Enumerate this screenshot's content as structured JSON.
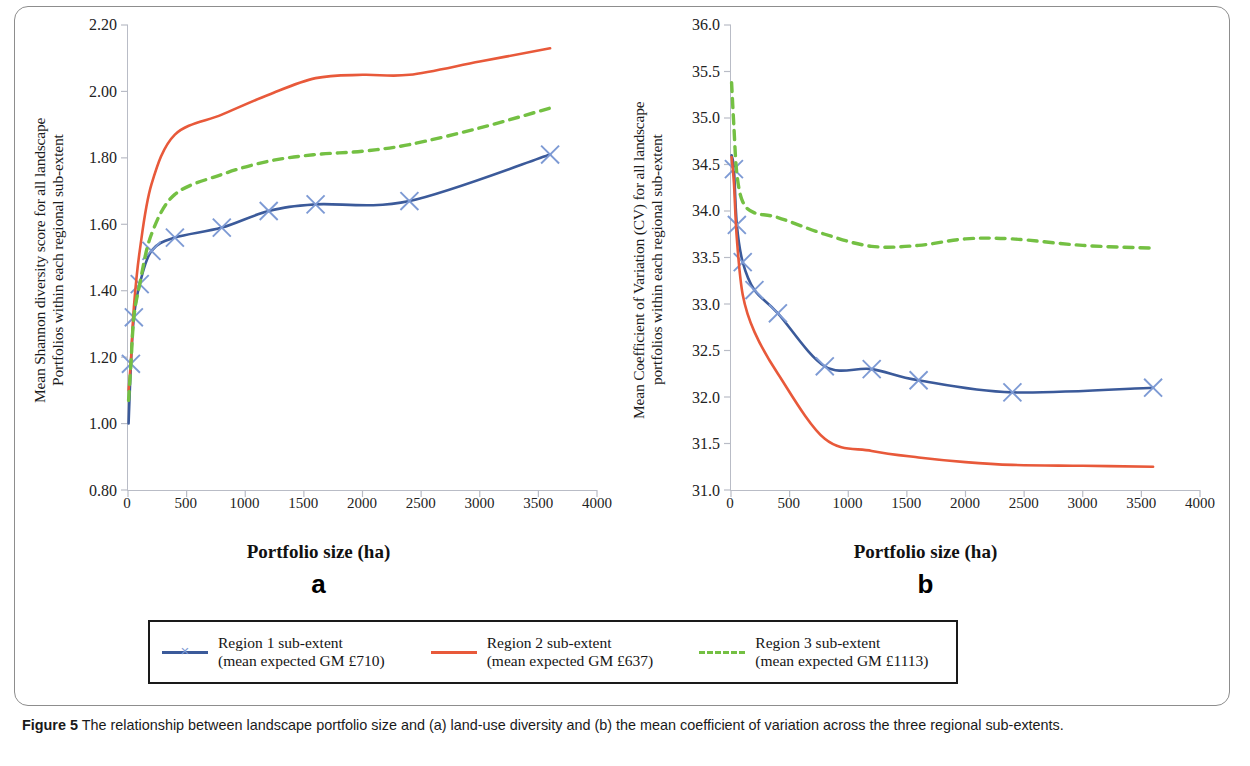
{
  "figure": {
    "caption_bold": "Figure 5",
    "caption_rest": " The relationship between landscape portfolio size and (a) land-use diversity and (b) the mean coefficient of variation across the three regional sub-extents."
  },
  "colors": {
    "region1": "#3b5a9a",
    "region2": "#e8593a",
    "region3": "#74c043",
    "marker": "#7d9ad4",
    "axis": "#b9bcc6",
    "frame": "#8d8d8d"
  },
  "legend": {
    "items": [
      {
        "label_line1": "Region 1 sub-extent",
        "label_line2": "(mean expected GM £710)",
        "color_key": "region1",
        "style": "solid",
        "marker": "x"
      },
      {
        "label_line1": "Region 2 sub-extent",
        "label_line2": "(mean expected GM £637)",
        "color_key": "region2",
        "style": "solid",
        "marker": "none"
      },
      {
        "label_line1": "Region 3 sub-extent",
        "label_line2": "(mean expected GM £1113)",
        "color_key": "region3",
        "style": "dashed",
        "marker": "none"
      }
    ]
  },
  "chart_data": [
    {
      "panel": "a",
      "type": "line",
      "title": "",
      "ylabel": "Mean Shannon diversity score for all landscape\nPortfolios within each regional sub-extent",
      "xlabel": "Portfolio size (ha)",
      "xlim": [
        0,
        4000
      ],
      "ylim": [
        0.8,
        2.2
      ],
      "xticks": [
        0,
        500,
        1000,
        1500,
        2000,
        2500,
        3000,
        3500,
        4000
      ],
      "xtick_labels": [
        "0",
        "500",
        "1000",
        "1500",
        "2000",
        "2500",
        "3000",
        "3500",
        "4000"
      ],
      "yticks": [
        0.8,
        1.0,
        1.2,
        1.4,
        1.6,
        1.8,
        2.0,
        2.2
      ],
      "ytick_labels": [
        "0.80",
        "1.00",
        "1.20",
        "1.40",
        "1.60",
        "1.80",
        "2.00",
        "2.20"
      ],
      "grid": false,
      "legend_position": "below",
      "series": [
        {
          "name": "Region 1 sub-extent",
          "color_key": "region1",
          "style": "solid",
          "markers": true,
          "x": [
            5,
            25,
            50,
            100,
            200,
            400,
            800,
            1200,
            1600,
            2400,
            3600
          ],
          "y": [
            1.0,
            1.18,
            1.32,
            1.42,
            1.52,
            1.56,
            1.59,
            1.64,
            1.66,
            1.67,
            1.81
          ],
          "marker_x": [
            25,
            50,
            100,
            200,
            400,
            800,
            1200,
            1600,
            2400,
            3600
          ],
          "marker_y": [
            1.18,
            1.32,
            1.42,
            1.52,
            1.56,
            1.59,
            1.64,
            1.66,
            1.67,
            1.81
          ]
        },
        {
          "name": "Region 2 sub-extent",
          "color_key": "region2",
          "style": "solid",
          "markers": false,
          "x": [
            5,
            25,
            50,
            100,
            200,
            400,
            800,
            1200,
            1600,
            2000,
            2400,
            3000,
            3600
          ],
          "y": [
            1.1,
            1.19,
            1.35,
            1.52,
            1.72,
            1.87,
            1.93,
            1.99,
            2.04,
            2.05,
            2.05,
            2.09,
            2.13
          ]
        },
        {
          "name": "Region 3 sub-extent",
          "color_key": "region3",
          "style": "dashed",
          "markers": false,
          "x": [
            5,
            25,
            50,
            100,
            200,
            400,
            800,
            1200,
            1600,
            2000,
            2400,
            3000,
            3600
          ],
          "y": [
            1.07,
            1.18,
            1.32,
            1.42,
            1.57,
            1.69,
            1.75,
            1.79,
            1.81,
            1.82,
            1.84,
            1.89,
            1.95
          ]
        }
      ]
    },
    {
      "panel": "b",
      "type": "line",
      "title": "",
      "ylabel": "Mean Coefficient of Variation (CV) for all landscape\nportfolios within each regional sub-extent",
      "xlabel": "Portfolio size (ha)",
      "xlim": [
        0,
        4000
      ],
      "ylim": [
        31.0,
        36.0
      ],
      "xticks": [
        0,
        500,
        1000,
        1500,
        2000,
        2500,
        3000,
        3500,
        4000
      ],
      "xtick_labels": [
        "0",
        "500",
        "1000",
        "1500",
        "2000",
        "2500",
        "3000",
        "3500",
        "4000"
      ],
      "yticks": [
        31.0,
        31.5,
        32.0,
        32.5,
        33.0,
        33.5,
        34.0,
        34.5,
        35.0,
        35.5,
        36.0
      ],
      "ytick_labels": [
        "31.0",
        "31.5",
        "32.0",
        "32.5",
        "33.0",
        "33.5",
        "34.0",
        "34.5",
        "35.0",
        "35.5",
        "36.0"
      ],
      "grid": false,
      "legend_position": "below",
      "series": [
        {
          "name": "Region 1 sub-extent",
          "color_key": "region1",
          "style": "solid",
          "markers": true,
          "x": [
            5,
            25,
            50,
            100,
            200,
            400,
            800,
            1200,
            1600,
            2400,
            3600
          ],
          "y": [
            34.6,
            34.45,
            33.85,
            33.45,
            33.15,
            32.9,
            32.33,
            32.3,
            32.18,
            32.05,
            32.1
          ],
          "marker_x": [
            25,
            50,
            100,
            200,
            400,
            800,
            1200,
            1600,
            2400,
            3600
          ],
          "marker_y": [
            34.45,
            33.85,
            33.45,
            33.15,
            32.9,
            32.33,
            32.3,
            32.18,
            32.05,
            32.1
          ]
        },
        {
          "name": "Region 2 sub-extent",
          "color_key": "region2",
          "style": "solid",
          "markers": false,
          "x": [
            5,
            25,
            50,
            100,
            200,
            400,
            800,
            1200,
            1600,
            2000,
            2400,
            3000,
            3600
          ],
          "y": [
            34.58,
            34.3,
            33.7,
            33.1,
            32.7,
            32.25,
            31.55,
            31.42,
            31.35,
            31.3,
            31.27,
            31.26,
            31.25
          ]
        },
        {
          "name": "Region 3 sub-extent",
          "color_key": "region3",
          "style": "dashed",
          "markers": false,
          "x": [
            5,
            25,
            50,
            100,
            200,
            400,
            800,
            1200,
            1600,
            2000,
            2400,
            3000,
            3600
          ],
          "y": [
            35.38,
            34.9,
            34.4,
            34.1,
            33.98,
            33.93,
            33.75,
            33.62,
            33.63,
            33.7,
            33.7,
            33.63,
            33.6
          ]
        }
      ]
    }
  ]
}
